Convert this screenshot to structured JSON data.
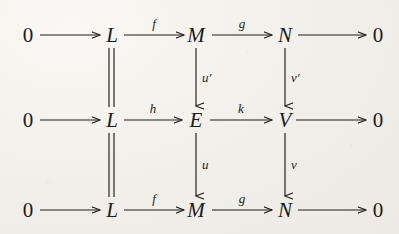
{
  "diagram": {
    "type": "commutative-diagram",
    "ink_color": "#1d1c1a",
    "background_color": "#f1efe9",
    "rows": [
      {
        "id": "row-top",
        "nodes": [
          "0",
          "L",
          "M",
          "N",
          "0"
        ],
        "arrow_labels": [
          "",
          "f",
          "g",
          ""
        ]
      },
      {
        "id": "row-middle",
        "nodes": [
          "0",
          "L",
          "E",
          "V",
          "0"
        ],
        "arrow_labels": [
          "",
          "h",
          "k",
          ""
        ]
      },
      {
        "id": "row-bottom",
        "nodes": [
          "0",
          "L",
          "M",
          "N",
          "0"
        ],
        "arrow_labels": [
          "",
          "f",
          "g",
          ""
        ]
      }
    ],
    "vertical_maps": [
      {
        "id": "L-top-to-middle",
        "label": "",
        "style": "equals"
      },
      {
        "id": "M-to-E",
        "label": "u′",
        "style": "arrow"
      },
      {
        "id": "N-to-V",
        "label": "v′",
        "style": "arrow"
      },
      {
        "id": "L-middle-to-bottom",
        "label": "",
        "style": "equals"
      },
      {
        "id": "E-to-M",
        "label": "u",
        "style": "arrow"
      },
      {
        "id": "V-to-N",
        "label": "v",
        "style": "arrow"
      }
    ],
    "nodes": {
      "r1c1": "0",
      "r1c2": "L",
      "r1c3": "M",
      "r1c4": "N",
      "r1c5": "0",
      "r2c1": "0",
      "r2c2": "L",
      "r2c3": "E",
      "r2c4": "V",
      "r2c5": "0",
      "r3c1": "0",
      "r3c2": "L",
      "r3c3": "M",
      "r3c4": "N",
      "r3c5": "0"
    },
    "labels": {
      "r1a2": "f",
      "r1a3": "g",
      "r2a2": "h",
      "r2a3": "k",
      "r3a2": "f",
      "r3a3": "g",
      "v_uprime": "u′",
      "v_vprime": "v′",
      "v_u": "u",
      "v_v": "v"
    }
  }
}
